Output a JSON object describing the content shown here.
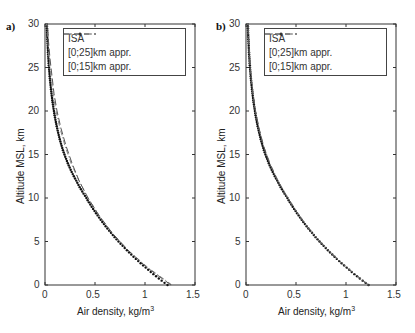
{
  "panels": [
    {
      "label": "a)",
      "xlabel": "Air density, kg/m",
      "xlabel_sup": "3",
      "ylabel": "Altitude MSL, km"
    },
    {
      "label": "b)",
      "xlabel": "Air density, kg/m",
      "xlabel_sup": "3",
      "ylabel": "Altitude MSL, km"
    }
  ],
  "x_ticks": [
    "0",
    "0.5",
    "1",
    "1.5"
  ],
  "y_ticks": [
    "0",
    "5",
    "10",
    "15",
    "20",
    "25",
    "30"
  ],
  "legend": [
    "ISA",
    "[0;25]km appr.",
    "[0;15]km appr."
  ],
  "chart_data": [
    {
      "type": "line",
      "title": "a)",
      "xlabel": "Air density, kg/m^3",
      "ylabel": "Altitude MSL, km",
      "xlim": [
        0,
        1.5
      ],
      "ylim": [
        0,
        30
      ],
      "x_ticks": [
        0,
        0.5,
        1,
        1.5
      ],
      "y_ticks": [
        0,
        5,
        10,
        15,
        20,
        25,
        30
      ],
      "grid": false,
      "legend_position": "upper right",
      "series": [
        {
          "name": "ISA",
          "style": "dots",
          "altitude_km": [
            0,
            2,
            4,
            6,
            8,
            10,
            12,
            14,
            16,
            18,
            20,
            22,
            24,
            26,
            28,
            30
          ],
          "density": [
            1.225,
            1.007,
            0.819,
            0.66,
            0.526,
            0.414,
            0.312,
            0.228,
            0.166,
            0.122,
            0.089,
            0.065,
            0.047,
            0.034,
            0.025,
            0.018
          ]
        },
        {
          "name": "[0;25]km appr.",
          "style": "dash-dot",
          "altitude_km": [
            0,
            2,
            4,
            6,
            8,
            10,
            12,
            14,
            16,
            18,
            20,
            22,
            24,
            26,
            28,
            30
          ],
          "density": [
            1.27,
            1.03,
            0.83,
            0.67,
            0.54,
            0.43,
            0.34,
            0.26,
            0.2,
            0.15,
            0.11,
            0.08,
            0.06,
            0.04,
            0.03,
            0.02
          ]
        },
        {
          "name": "[0;15]km appr.",
          "style": "dashed",
          "altitude_km": [
            0,
            2,
            4,
            6,
            8,
            10,
            12,
            14,
            16,
            18,
            20,
            22,
            24,
            26,
            28,
            30
          ],
          "density": [
            1.26,
            1.02,
            0.83,
            0.67,
            0.54,
            0.43,
            0.34,
            0.27,
            0.21,
            0.16,
            0.12,
            0.09,
            0.07,
            0.05,
            0.035,
            0.025
          ]
        }
      ]
    },
    {
      "type": "line",
      "title": "b)",
      "xlabel": "Air density, kg/m^3",
      "ylabel": "Altitude MSL, km",
      "xlim": [
        0,
        1.5
      ],
      "ylim": [
        0,
        30
      ],
      "x_ticks": [
        0,
        0.5,
        1,
        1.5
      ],
      "y_ticks": [
        0,
        5,
        10,
        15,
        20,
        25,
        30
      ],
      "grid": false,
      "legend_position": "upper right",
      "series": [
        {
          "name": "ISA",
          "style": "dots",
          "altitude_km": [
            0,
            2,
            4,
            6,
            8,
            10,
            12,
            14,
            16,
            18,
            20,
            22,
            24,
            26,
            28,
            30
          ],
          "density": [
            1.225,
            1.007,
            0.819,
            0.66,
            0.526,
            0.414,
            0.312,
            0.228,
            0.166,
            0.122,
            0.089,
            0.065,
            0.047,
            0.034,
            0.025,
            0.018
          ]
        },
        {
          "name": "[0;25]km appr.",
          "style": "dash-dot",
          "altitude_km": [
            0,
            2,
            4,
            6,
            8,
            10,
            12,
            14,
            16,
            18,
            20,
            22,
            24,
            26,
            28,
            30
          ],
          "density": [
            1.225,
            1.01,
            0.82,
            0.66,
            0.53,
            0.42,
            0.32,
            0.24,
            0.175,
            0.13,
            0.095,
            0.07,
            0.05,
            0.037,
            0.027,
            0.02
          ]
        },
        {
          "name": "[0;15]km appr.",
          "style": "dashed",
          "altitude_km": [
            0,
            2,
            4,
            6,
            8,
            10,
            12,
            14,
            16,
            18,
            20,
            22,
            24,
            26,
            28,
            30
          ],
          "density": [
            1.225,
            1.005,
            0.82,
            0.66,
            0.53,
            0.415,
            0.315,
            0.235,
            0.175,
            0.13,
            0.095,
            0.07,
            0.05,
            0.037,
            0.027,
            0.02
          ]
        }
      ]
    }
  ]
}
